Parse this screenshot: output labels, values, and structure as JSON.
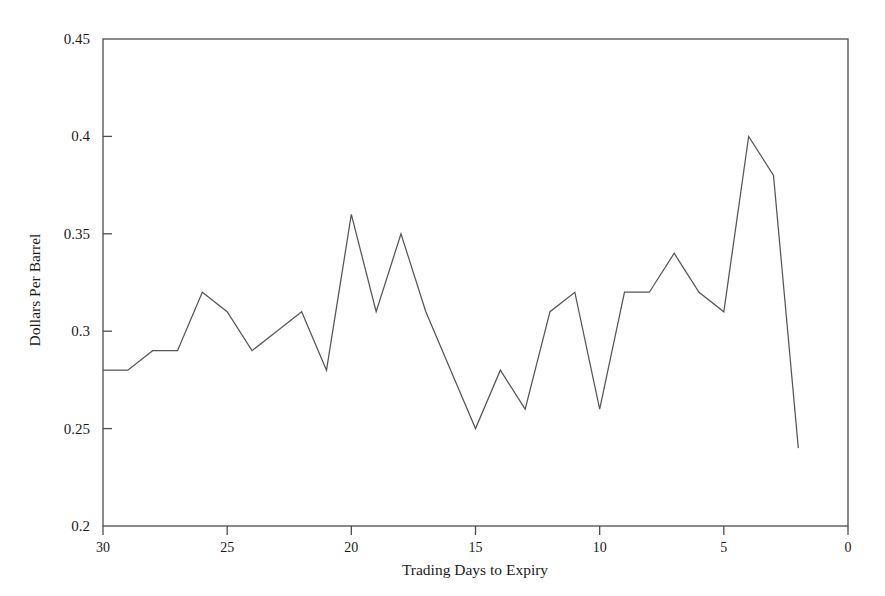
{
  "chart_data": {
    "type": "line",
    "title": "",
    "xlabel": "Trading Days to Expiry",
    "ylabel": "Dollars Per Barrel",
    "xlim": [
      30,
      0
    ],
    "ylim": [
      0.2,
      0.45
    ],
    "x_reversed": true,
    "grid": false,
    "legend": null,
    "x_ticks": [
      30,
      25,
      20,
      15,
      10,
      5,
      0
    ],
    "x_tick_labels": [
      "30",
      "25",
      "20",
      "15",
      "10",
      "5",
      "0"
    ],
    "y_ticks": [
      0.2,
      0.25,
      0.3,
      0.35,
      0.4,
      0.45
    ],
    "y_tick_labels": [
      "0.2",
      "0.25",
      "0.3",
      "0.35",
      "0.4",
      "0.45"
    ],
    "series": [
      {
        "name": "Dollars Per Barrel",
        "color": "#555555",
        "x": [
          30,
          29,
          28,
          27,
          26,
          25,
          24,
          23,
          22,
          21,
          20,
          19,
          18,
          17,
          16,
          15,
          14,
          13,
          12,
          11,
          10,
          9,
          8,
          7,
          6,
          5,
          4,
          3,
          2
        ],
        "values": [
          0.28,
          0.28,
          0.29,
          0.29,
          0.32,
          0.31,
          0.29,
          0.3,
          0.31,
          0.28,
          0.36,
          0.31,
          0.35,
          0.31,
          0.28,
          0.25,
          0.28,
          0.26,
          0.31,
          0.32,
          0.26,
          0.32,
          0.32,
          0.34,
          0.32,
          0.31,
          0.4,
          0.38,
          0.24
        ]
      }
    ]
  },
  "axes": {
    "x_label": "Trading Days to Expiry",
    "y_label": "Dollars Per Barrel"
  }
}
